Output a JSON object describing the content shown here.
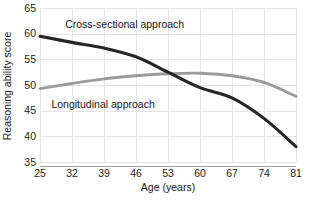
{
  "chart_data": {
    "type": "line",
    "title": "",
    "xlabel": "Age (years)",
    "ylabel": "Reasoning ability score",
    "x": [
      25,
      32,
      39,
      46,
      53,
      60,
      67,
      74,
      81
    ],
    "xticklabels": [
      "25",
      "32",
      "39",
      "46",
      "53",
      "60",
      "67",
      "74",
      "81"
    ],
    "yticks": [
      35,
      40,
      45,
      50,
      55,
      60,
      65
    ],
    "yticklabels": [
      "35",
      "40",
      "45",
      "50",
      "55",
      "60",
      "65"
    ],
    "xlim": [
      25,
      81
    ],
    "ylim": [
      35,
      65
    ],
    "grid": true,
    "legend_position": "inline-annotation",
    "series": [
      {
        "name": "Cross-sectional approach",
        "color": "#262626",
        "values": [
          59.5,
          58.3,
          57.2,
          55.5,
          52.5,
          49.5,
          47.5,
          43.5,
          38.0
        ]
      },
      {
        "name": "Longitudinal approach",
        "color": "#9a9a9a",
        "values": [
          49.3,
          50.3,
          51.2,
          51.8,
          52.2,
          52.3,
          51.8,
          50.5,
          47.8
        ]
      }
    ],
    "annotations": [
      {
        "text": "Cross-sectional approach",
        "x": 30.5,
        "y": 61.8
      },
      {
        "text": "Longitudinal approach",
        "x": 27.5,
        "y": 46.2
      }
    ]
  },
  "axes": {
    "x_title": "Age (years)",
    "y_title": "Reasoning ability score"
  },
  "colors": {
    "cross_sectional": "#262626",
    "longitudinal": "#9a9a9a",
    "grid": "#e3e3e3",
    "axis": "#9a9a9a",
    "text": "#1a1a1a",
    "background": "#ffffff"
  }
}
